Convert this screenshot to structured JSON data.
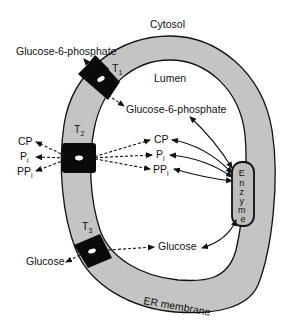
{
  "diagram": {
    "regions": {
      "cytosol": "Cytosol",
      "lumen": "Lumen",
      "membrane": "ER membrane"
    },
    "colors": {
      "membrane_fill": "#c4c4c4",
      "transporter_fill": "#0a0a0a",
      "enzyme_fill": "#bdbdbd",
      "line": "#111111",
      "background": "#ffffff"
    },
    "transporters": [
      {
        "id": "T1",
        "letter": "T",
        "sub": "1"
      },
      {
        "id": "T2",
        "letter": "T",
        "sub": "2"
      },
      {
        "id": "T3",
        "letter": "T",
        "sub": "3"
      }
    ],
    "enzyme": {
      "letters": [
        "E",
        "n",
        "z",
        "y",
        "m",
        "e"
      ]
    },
    "cytosol_labels": {
      "g6p": "Glucose-6-phosphate",
      "cp": "CP",
      "pi_main": "P",
      "pi_sub": "i",
      "ppi_main": "PP",
      "ppi_sub": "i",
      "glucose": "Glucose"
    },
    "lumen_labels": {
      "g6p": "Glucose-6-phosphate",
      "cp": "CP",
      "pi_main": "P",
      "pi_sub": "i",
      "ppi_main": "PP",
      "ppi_sub": "i",
      "glucose": "Glucose"
    }
  }
}
